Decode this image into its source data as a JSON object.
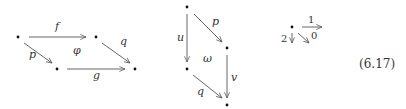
{
  "diagrams": [
    {
      "name": "square-phi",
      "nodes": [
        {
          "id": "a",
          "x": 18,
          "y": 37
        },
        {
          "id": "b",
          "x": 96,
          "y": 37
        },
        {
          "id": "c",
          "x": 57,
          "y": 69
        },
        {
          "id": "d",
          "x": 135,
          "y": 69
        }
      ],
      "labels": {
        "f": "f",
        "p": "p",
        "q": "q",
        "g": "g",
        "cell": "φ"
      }
    },
    {
      "name": "square-omega",
      "nodes": [
        {
          "id": "a",
          "x": 187,
          "y": 7
        },
        {
          "id": "b",
          "x": 227,
          "y": 48
        },
        {
          "id": "c",
          "x": 187,
          "y": 69
        },
        {
          "id": "d",
          "x": 227,
          "y": 105
        }
      ],
      "labels": {
        "p": "p",
        "u": "u",
        "v": "v",
        "q": "q",
        "cell": "ω"
      }
    },
    {
      "name": "basic-graph",
      "nodes": [
        {
          "id": "o",
          "x": 292,
          "y": 27
        }
      ],
      "labels": {
        "right": "1",
        "down": "2",
        "diag": "0"
      }
    }
  ],
  "equation_number": "(6.17)"
}
